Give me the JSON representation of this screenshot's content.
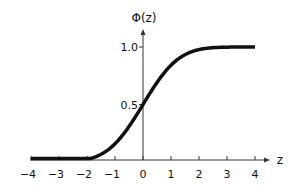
{
  "chart_data": {
    "type": "line",
    "title": "",
    "xlabel": "z",
    "ylabel": "Φ(z)",
    "xlim": [
      -4,
      4
    ],
    "ylim": [
      0,
      1.0
    ],
    "x_ticks": [
      "−4",
      "−3",
      "−2",
      "−1",
      "0",
      "1",
      "2",
      "3",
      "4"
    ],
    "y_ticks": [
      "0.5",
      "1.0"
    ],
    "grid": false,
    "legend": null,
    "series": [
      {
        "name": "Φ(z) standard normal CDF",
        "x": [
          -4,
          -3,
          -2,
          -1.5,
          -1,
          -0.5,
          0,
          0.5,
          1,
          1.5,
          2,
          3,
          4
        ],
        "values": [
          0.0,
          0.001,
          0.023,
          0.067,
          0.159,
          0.309,
          0.5,
          0.691,
          0.841,
          0.933,
          0.977,
          0.999,
          1.0
        ]
      }
    ]
  },
  "colors": {
    "curve": "#111111",
    "axis": "#333333",
    "background": "#ffffff"
  }
}
